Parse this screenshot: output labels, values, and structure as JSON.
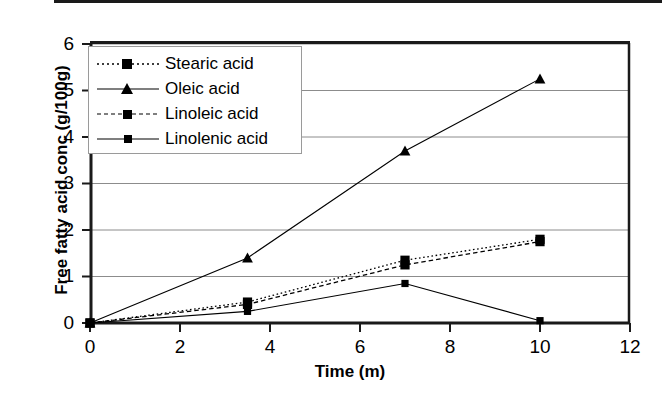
{
  "chart_data": {
    "type": "line",
    "title": "",
    "xlabel": "Time (m)",
    "ylabel": "Free fatty acid conc (g/100g)",
    "xlim": [
      0,
      12
    ],
    "ylim": [
      0,
      6
    ],
    "xticks": [
      "0",
      "2",
      "4",
      "6",
      "8",
      "10",
      "12"
    ],
    "yticks": [
      "0",
      "1",
      "2",
      "3",
      "4",
      "5",
      "6"
    ],
    "grid": "horizontal",
    "legend_position": "upper-left-inside",
    "x": [
      0,
      3.5,
      7,
      10
    ],
    "series": [
      {
        "name": "Stearic acid",
        "values": [
          0,
          0.45,
          1.35,
          1.8
        ],
        "marker": "square",
        "line": "dotted",
        "color": "#000000"
      },
      {
        "name": "Oleic acid",
        "values": [
          0,
          1.4,
          3.7,
          5.25
        ],
        "marker": "triangle",
        "line": "solid",
        "color": "#000000"
      },
      {
        "name": "Linoleic acid",
        "values": [
          0,
          0.4,
          1.25,
          1.75
        ],
        "marker": "square",
        "line": "dashed",
        "color": "#000000"
      },
      {
        "name": "Linolenic acid",
        "values": [
          0,
          0.25,
          0.85,
          0.05
        ],
        "marker": "square-small",
        "line": "solid",
        "color": "#000000"
      }
    ]
  },
  "axes": {
    "x_title": "Time (m)",
    "y_title": "Free fatty acid conc (g/100g)",
    "x_tick_labels": [
      "0",
      "2",
      "4",
      "6",
      "8",
      "10",
      "12"
    ],
    "y_tick_labels": [
      "0",
      "1",
      "2",
      "3",
      "4",
      "5",
      "6"
    ]
  },
  "legend": {
    "entries": [
      {
        "label": "Stearic acid"
      },
      {
        "label": "Oleic acid"
      },
      {
        "label": "Linoleic acid"
      },
      {
        "label": "Linolenic acid"
      }
    ]
  },
  "colors": {
    "ink": "#000000",
    "gridline": "#8c8c8c",
    "axis": "#1a1a1a",
    "background": "#ffffff"
  }
}
